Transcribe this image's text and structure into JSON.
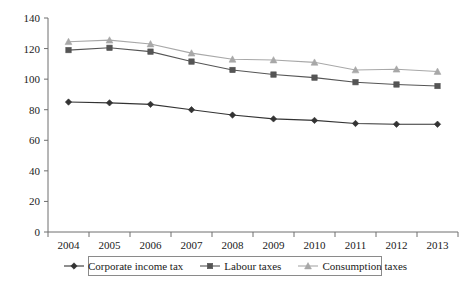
{
  "chart_data": {
    "type": "line",
    "title": "",
    "subtitle": "",
    "xlabel": "",
    "ylabel": "",
    "categories": [
      "2004",
      "2005",
      "2006",
      "2007",
      "2008",
      "2009",
      "2010",
      "2011",
      "2012",
      "2013"
    ],
    "ylim": [
      0,
      140
    ],
    "y_ticks": [
      0,
      20,
      40,
      60,
      80,
      100,
      120,
      140
    ],
    "y_tick_labels": [
      "0",
      "20",
      "40",
      "60",
      "80",
      "100",
      "120",
      "140"
    ],
    "grid": false,
    "legend_position": "bottom",
    "series": [
      {
        "name": "Corporate income tax",
        "marker": "diamond",
        "color": "#333333",
        "values": [
          85,
          84.5,
          83.5,
          80,
          76.5,
          74,
          73,
          71,
          70.5,
          70.5
        ]
      },
      {
        "name": "Labour taxes",
        "marker": "square",
        "color": "#555555",
        "values": [
          119,
          120.5,
          118,
          111.5,
          106,
          103,
          101,
          98,
          96.5,
          95.5
        ]
      },
      {
        "name": "Consumption taxes",
        "marker": "triangle",
        "color": "#a8a8a8",
        "values": [
          124.5,
          125.5,
          123,
          117,
          113,
          112.5,
          111,
          106,
          106.5,
          105
        ]
      }
    ]
  },
  "legend": {
    "items": [
      {
        "label": "Corporate income tax",
        "marker": "diamond",
        "color": "#333333"
      },
      {
        "label": "Labour taxes",
        "marker": "square",
        "color": "#555555"
      },
      {
        "label": "Consumption taxes",
        "marker": "triangle",
        "color": "#a8a8a8"
      }
    ]
  },
  "axes": {
    "axis_color": "#6e6e6e",
    "tick_color": "#6e6e6e"
  }
}
